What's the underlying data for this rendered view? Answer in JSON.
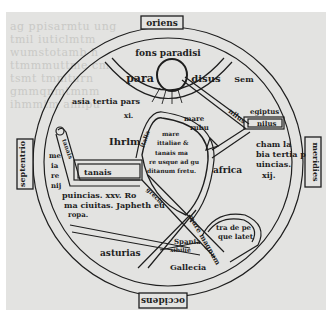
{
  "map": {
    "title": "T-O world map",
    "colors": {
      "ink": "#1e1e1e",
      "parchment": "#e3e3e1",
      "background": "#ffffff",
      "bleed": "#c9c9c6"
    },
    "cardinal": {
      "top": "oriens",
      "bottom": "occidens",
      "left": "septentrio",
      "right": "meridies"
    },
    "paradise": {
      "fountain": "fons paradisi",
      "left": "para",
      "right": "disus"
    },
    "labels": {
      "sem": "Sem",
      "nilus_diag": "nilus",
      "egiptus": "egiptus",
      "nilus_box": "nilus",
      "mare_rubrum_1": "mare",
      "mare_rubrum_2": "rubu",
      "asia_1": "asia tertia pars",
      "asia_2": "xi.",
      "ihrlm": "Ihrlm",
      "tanais_river": "tanais",
      "tanais_box": "tanais",
      "left_col": [
        "me",
        "ia",
        "re",
        "nij"
      ],
      "cham_1": "cham la",
      "cham_2": "bia tertia p",
      "cham_3": "uincias.",
      "cham_4": "xij.",
      "africa": "africa",
      "sea_1": "mare",
      "sea_2": "ittaliae &",
      "sea_3": "tanais ma",
      "sea_4": "re usque ad gu",
      "sea_5": "ditanum fretu.",
      "sea_side": "italia",
      "europa_1": "puincias. xxv. Ro",
      "europa_2": "ma ciuitas. Japheth eu",
      "europa_3": "ropa.",
      "grecia": "grecia",
      "mare_magnum": "mare magnum",
      "terra_1": "tra de pe",
      "terra_2": "que latet",
      "hispania_1": "Spania",
      "hispania_2": "xibilie",
      "asturias": "asturias",
      "gallecia": "Gallecia"
    },
    "bleed_text": [
      "ag ppisarmtu ung",
      "tmil iuticlmtm",
      "wumstotamb h",
      "ttmmmuttme cm",
      "tsmt tmmturn",
      "gmmqnmtmnm",
      "ihmmtm amlpu"
    ]
  }
}
